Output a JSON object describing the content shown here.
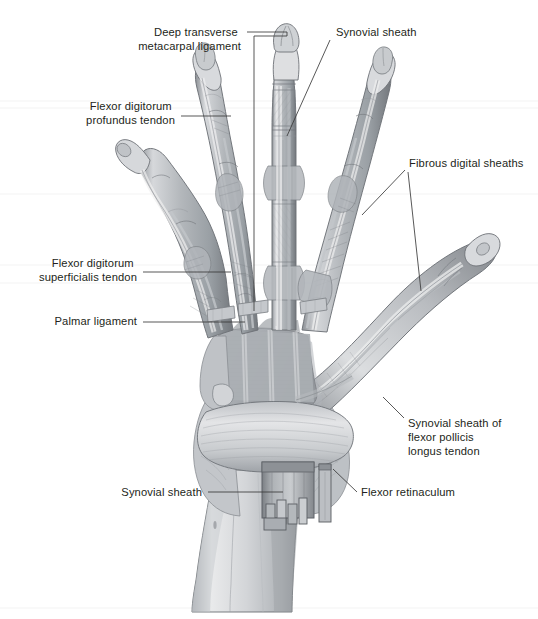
{
  "figure": {
    "type": "anatomical-illustration",
    "background_color": "#ffffff",
    "ink_color": "#231f20",
    "leader_color": "#3a3a3a",
    "tone_light": "#e8e9ea",
    "tone_mid": "#b9bcc0",
    "tone_dark": "#8f9398",
    "tone_darker": "#6e7276",
    "outline": "#4a4e52"
  },
  "labels": [
    {
      "id": "deep-transverse-metacarpal-ligament",
      "lines": [
        "Deep transverse",
        "metacarpal ligament"
      ],
      "align": "right",
      "text_x": 241,
      "text_y": 36,
      "line_height": 14
    },
    {
      "id": "synovial-sheath-top",
      "lines": [
        "Synovial sheath"
      ],
      "align": "left",
      "text_x": 336,
      "text_y": 36,
      "line_height": 14
    },
    {
      "id": "flexor-digitorum-profundus-tendon",
      "lines": [
        "Flexor digitorum",
        "profundus tendon"
      ],
      "align": "right",
      "text_x": 175,
      "text_y": 110,
      "line_height": 14
    },
    {
      "id": "fibrous-digital-sheaths",
      "lines": [
        "Fibrous digital sheaths"
      ],
      "align": "left",
      "text_x": 409,
      "text_y": 167,
      "line_height": 14
    },
    {
      "id": "flexor-digitorum-superficialis-tendon",
      "lines": [
        "Flexor digitorum",
        "superficialis tendon"
      ],
      "align": "right",
      "text_x": 137,
      "text_y": 267,
      "line_height": 14
    },
    {
      "id": "palmar-ligament",
      "lines": [
        "Palmar ligament"
      ],
      "align": "right",
      "text_x": 137,
      "text_y": 325,
      "line_height": 14
    },
    {
      "id": "synovial-sheath-of-flexor-pollicis-longus-tendon",
      "lines": [
        "Synovial sheath of",
        "flexor pollicis",
        "longus tendon"
      ],
      "align": "left",
      "text_x": 408,
      "text_y": 427,
      "line_height": 14
    },
    {
      "id": "synovial-sheath-bottom",
      "lines": [
        "Synovial sheath"
      ],
      "align": "right",
      "text_x": 202,
      "text_y": 496,
      "line_height": 14
    },
    {
      "id": "flexor-retinaculum",
      "lines": [
        "Flexor retinaculum"
      ],
      "align": "left",
      "text_x": 361,
      "text_y": 496,
      "line_height": 14
    }
  ],
  "leaders": [
    {
      "id": "leader-deep-transverse-metacarpal-ligament",
      "points": "247,32 287,32 287,36 254,36 254,311"
    },
    {
      "id": "leader-synovial-sheath-top",
      "points": "330,40 287,136"
    },
    {
      "id": "leader-flexor-digitorum-profundus-tendon",
      "points": "181,116 231,116"
    },
    {
      "id": "leader-fibrous-digital-sheaths-left",
      "points": "405,170 362,215"
    },
    {
      "id": "leader-fibrous-digital-sheaths-right",
      "points": "408,172 421,291"
    },
    {
      "id": "leader-flexor-digitorum-superficialis-tendon",
      "points": "143,272 231,272"
    },
    {
      "id": "leader-palmar-ligament",
      "points": "143,322 245,322"
    },
    {
      "id": "leader-synovial-sheath-flexor-pollicis-longus",
      "points": "404,418 383,397"
    },
    {
      "id": "leader-synovial-sheath-bottom",
      "points": "208,492 283,492"
    },
    {
      "id": "leader-flexor-retinaculum",
      "points": "357,492 333,469"
    }
  ],
  "anatomy": {
    "digits": [
      {
        "id": "digit-little-finger",
        "name": "little finger (5th digit)"
      },
      {
        "id": "digit-ring-finger",
        "name": "ring finger (4th digit)"
      },
      {
        "id": "digit-middle-finger",
        "name": "middle finger (3rd digit)"
      },
      {
        "id": "digit-index-finger",
        "name": "index finger (2nd digit)"
      },
      {
        "id": "digit-thumb",
        "name": "thumb (1st digit)"
      }
    ],
    "structures": [
      {
        "id": "palm-aponeurosis",
        "name": "palmar aponeurosis / metacarpal region"
      },
      {
        "id": "flexor-retinaculum-band",
        "name": "flexor retinaculum (transverse carpal ligament)"
      },
      {
        "id": "carpal-tunnel-window",
        "name": "cut window exposing common flexor synovial sheath"
      },
      {
        "id": "radius-ulna-shaft",
        "name": "distal radius and ulna"
      }
    ]
  }
}
